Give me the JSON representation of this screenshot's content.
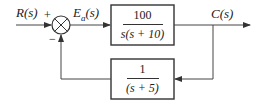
{
  "diagram": {
    "type": "feedback-control-block-diagram",
    "input_label": "R(s)",
    "error_label": "E",
    "error_subscript": "a",
    "error_suffix": "(s)",
    "output_label": "C(s)",
    "summing_junction": {
      "plus_sign": "+",
      "minus_sign": "−"
    },
    "forward_block": {
      "numerator": "100",
      "denominator": "s(s + 10)"
    },
    "feedback_block": {
      "numerator": "1",
      "denominator": "(s + 5)"
    },
    "colors": {
      "line": "#444444",
      "text": "#222222",
      "background": "#ffffff"
    }
  }
}
